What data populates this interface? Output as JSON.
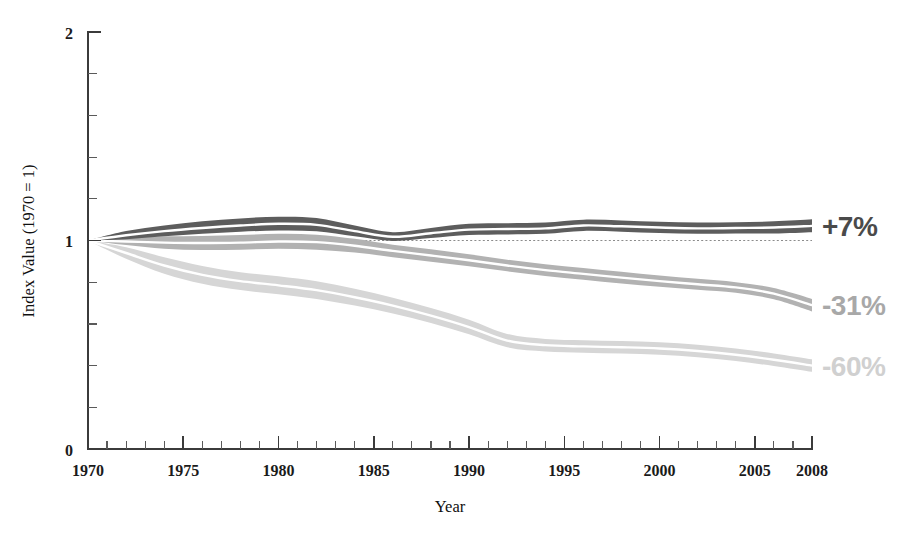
{
  "chart_data": {
    "type": "area",
    "title": "",
    "subtitle": "",
    "xlabel": "Year",
    "ylabel": "Index Value (1970 = 1)",
    "xlim": [
      1970,
      2008
    ],
    "ylim": [
      0,
      2
    ],
    "grid": false,
    "legend_position": "right-inline-annotations",
    "reference_line": {
      "y": 1,
      "style": "dotted"
    },
    "x_ticks_major": [
      1970,
      1975,
      1980,
      1985,
      1990,
      1995,
      2000,
      2005,
      2008
    ],
    "x_tick_labels": [
      "1970",
      "1975",
      "1980",
      "1985",
      "1990",
      "1995",
      "2000",
      "2005",
      "2008"
    ],
    "x_ticks_minor_step": 1,
    "y_ticks_major": [
      0,
      1,
      2
    ],
    "y_tick_labels": [
      "0",
      "1",
      "2"
    ],
    "y_ticks_minor_step": 0.2,
    "x": [
      1970,
      1972,
      1974,
      1976,
      1978,
      1980,
      1982,
      1984,
      1986,
      1988,
      1990,
      1992,
      1994,
      1996,
      1998,
      2000,
      2002,
      2004,
      2006,
      2008
    ],
    "series": [
      {
        "name": "+7%",
        "label": "+7%",
        "color": "#5d5d5d",
        "band_color": "#5d5d5d",
        "end_change_pct": 7,
        "values": [
          1.0,
          1.025,
          1.045,
          1.06,
          1.072,
          1.08,
          1.075,
          1.045,
          1.018,
          1.035,
          1.052,
          1.055,
          1.058,
          1.072,
          1.068,
          1.062,
          1.058,
          1.06,
          1.062,
          1.07
        ],
        "band_upper": [
          1.0,
          1.045,
          1.072,
          1.092,
          1.106,
          1.114,
          1.108,
          1.072,
          1.04,
          1.06,
          1.08,
          1.083,
          1.086,
          1.1,
          1.096,
          1.09,
          1.086,
          1.088,
          1.092,
          1.102
        ],
        "band_lower": [
          1.0,
          1.006,
          1.02,
          1.032,
          1.042,
          1.048,
          1.044,
          1.02,
          0.998,
          1.012,
          1.026,
          1.029,
          1.032,
          1.046,
          1.042,
          1.036,
          1.032,
          1.034,
          1.034,
          1.04
        ]
      },
      {
        "name": "-31%",
        "label": "-31%",
        "color": "#b2b2b2",
        "band_color": "#b2b2b2",
        "end_change_pct": -31,
        "values": [
          1.0,
          0.995,
          0.99,
          0.988,
          0.99,
          0.995,
          0.992,
          0.975,
          0.95,
          0.928,
          0.905,
          0.88,
          0.858,
          0.84,
          0.822,
          0.805,
          0.79,
          0.775,
          0.745,
          0.69
        ],
        "band_upper": [
          1.0,
          1.012,
          1.02,
          1.022,
          1.026,
          1.032,
          1.028,
          1.008,
          0.98,
          0.958,
          0.934,
          0.908,
          0.886,
          0.868,
          0.85,
          0.832,
          0.816,
          0.8,
          0.772,
          0.72
        ],
        "band_lower": [
          1.0,
          0.978,
          0.96,
          0.954,
          0.956,
          0.96,
          0.956,
          0.942,
          0.92,
          0.898,
          0.876,
          0.852,
          0.83,
          0.812,
          0.794,
          0.778,
          0.764,
          0.75,
          0.718,
          0.66
        ]
      },
      {
        "name": "-60%",
        "label": "-60%",
        "color": "#d6d6d6",
        "band_color": "#d6d6d6",
        "end_change_pct": -60,
        "values": [
          1.0,
          0.94,
          0.88,
          0.835,
          0.805,
          0.785,
          0.762,
          0.728,
          0.688,
          0.64,
          0.585,
          0.52,
          0.498,
          0.492,
          0.488,
          0.482,
          0.47,
          0.452,
          0.428,
          0.4
        ],
        "band_upper": [
          1.0,
          0.968,
          0.92,
          0.878,
          0.848,
          0.828,
          0.804,
          0.768,
          0.726,
          0.676,
          0.62,
          0.552,
          0.528,
          0.522,
          0.518,
          0.512,
          0.5,
          0.482,
          0.458,
          0.43
        ],
        "band_lower": [
          1.0,
          0.912,
          0.84,
          0.792,
          0.762,
          0.742,
          0.72,
          0.688,
          0.65,
          0.604,
          0.55,
          0.488,
          0.468,
          0.462,
          0.458,
          0.452,
          0.44,
          0.422,
          0.398,
          0.37
        ]
      }
    ],
    "annotations": [
      {
        "text": "+7%",
        "series": "+7%",
        "color": "#4a4a4a",
        "y_value": 1.07
      },
      {
        "text": "-31%",
        "series": "-31%",
        "color": "#a8a8a8",
        "y_value": 0.69
      },
      {
        "text": "-60%",
        "series": "-60%",
        "color": "#d0d0d0",
        "y_value": 0.4
      }
    ]
  },
  "axes": {
    "x_title": "Year",
    "y_title": "Index Value (1970 = 1)",
    "y_labels": {
      "bottom": "0",
      "middle": "1",
      "top": "2"
    },
    "x_labels": [
      "1970",
      "1975",
      "1980",
      "1985",
      "1990",
      "1995",
      "2000",
      "2005",
      "2008"
    ]
  },
  "colors": {
    "dark_band": "#5d5d5d",
    "medium_band": "#b2b2b2",
    "light_band": "#d6d6d6",
    "axis": "#3b3b3b",
    "text": "#101010",
    "background": "#ffffff"
  }
}
